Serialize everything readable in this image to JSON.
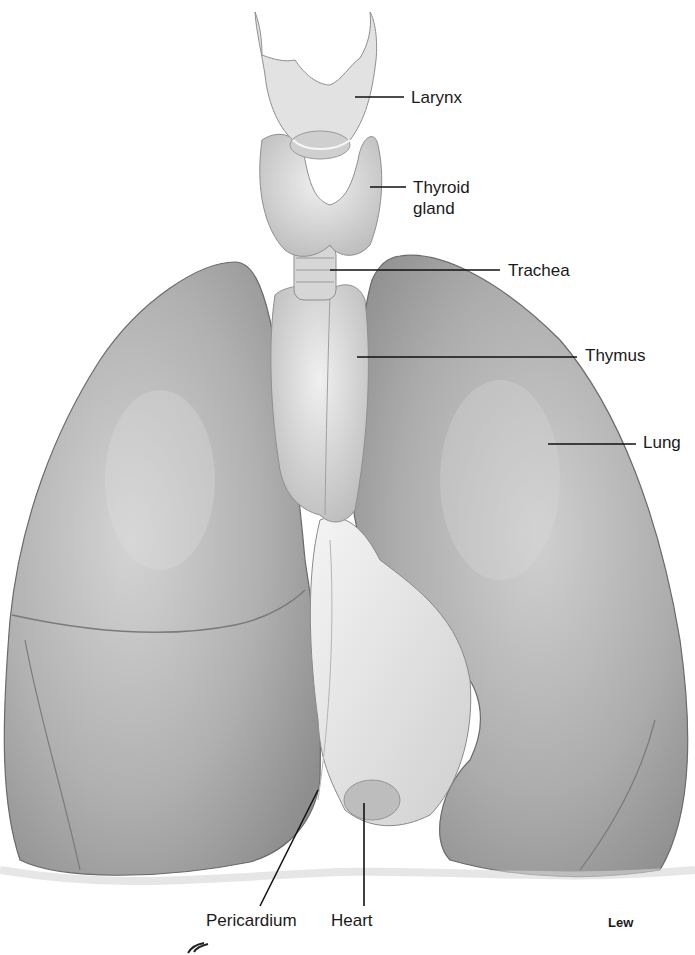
{
  "figure": {
    "credit": "Lew",
    "colors": {
      "background": "#ffffff",
      "lung": "#a9a9a9",
      "lung_light": "#cfcfcf",
      "gland": "#dcdcdc",
      "pericardium": "#ededed",
      "leader": "#111111",
      "text": "#1a1a1a"
    }
  },
  "labels": [
    {
      "id": "larynx",
      "text": "Larynx",
      "x": 411,
      "y": 87,
      "line": [
        355,
        97,
        404,
        97
      ]
    },
    {
      "id": "thyroid",
      "text": "Thyroid\ngland",
      "x": 413,
      "y": 177,
      "line": [
        370,
        187,
        406,
        187
      ]
    },
    {
      "id": "trachea",
      "text": "Trachea",
      "x": 508,
      "y": 260,
      "line": [
        330,
        270,
        500,
        270
      ]
    },
    {
      "id": "thymus",
      "text": "Thymus",
      "x": 585,
      "y": 345,
      "line": [
        357,
        357,
        577,
        357
      ]
    },
    {
      "id": "lung",
      "text": "Lung",
      "x": 643,
      "y": 432,
      "line": [
        548,
        444,
        636,
        444
      ]
    },
    {
      "id": "pericardium",
      "text": "Pericardium",
      "x": 206,
      "y": 910,
      "line": [
        318,
        790,
        260,
        906
      ]
    },
    {
      "id": "heart",
      "text": "Heart",
      "x": 331,
      "y": 910,
      "line": [
        364,
        803,
        364,
        906
      ]
    }
  ]
}
